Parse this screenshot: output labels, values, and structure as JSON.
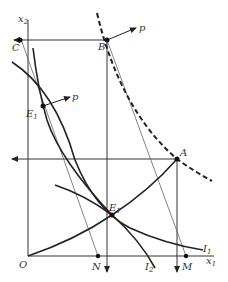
{
  "diagram": {
    "axes": {
      "x_label": "x",
      "x_sub": "1",
      "y_label": "x",
      "y_sub": "2",
      "origin": "O"
    },
    "points": {
      "A": "A",
      "B": "B",
      "C": "C",
      "M": "M",
      "N": "N",
      "E1_upper": "E",
      "E1_lower": "E",
      "E_sub": "1"
    },
    "vectors": {
      "p_top": "p",
      "p_mid": "p"
    },
    "curves": {
      "I1": "I",
      "I1_sub": "1",
      "I2": "I",
      "I2_sub": "2"
    },
    "colors": {
      "ink": "#222222",
      "thin": "#555555",
      "background": "#ffffff"
    }
  }
}
